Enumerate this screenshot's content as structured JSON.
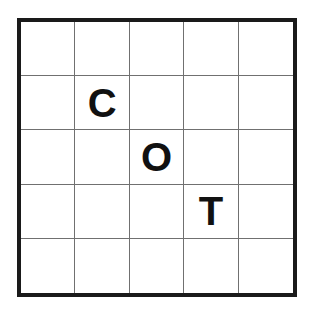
{
  "puzzle": {
    "rows": 5,
    "cols": 5,
    "cells": [
      [
        "",
        "",
        "",
        "",
        ""
      ],
      [
        "",
        "C",
        "",
        "",
        ""
      ],
      [
        "",
        "",
        "O",
        "",
        ""
      ],
      [
        "",
        "",
        "",
        "T",
        ""
      ],
      [
        "",
        "",
        "",
        "",
        ""
      ]
    ]
  }
}
